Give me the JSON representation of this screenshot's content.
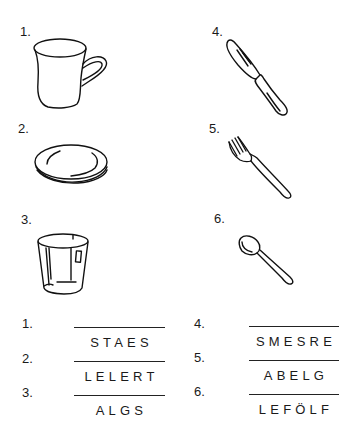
{
  "pictures": [
    {
      "number": "1.",
      "icon": "cup-icon",
      "label": "cup"
    },
    {
      "number": "2.",
      "icon": "plate-icon",
      "label": "plate"
    },
    {
      "number": "3.",
      "icon": "glass-icon",
      "label": "glass"
    },
    {
      "number": "4.",
      "icon": "knife-icon",
      "label": "knife"
    },
    {
      "number": "5.",
      "icon": "fork-icon",
      "label": "fork"
    },
    {
      "number": "6.",
      "icon": "spoon-icon",
      "label": "spoon"
    }
  ],
  "scrambled_words": [
    {
      "number": "1.",
      "letters": "STAES",
      "answer": ""
    },
    {
      "number": "2.",
      "letters": "LELERT",
      "answer": ""
    },
    {
      "number": "3.",
      "letters": "ALGS",
      "answer": ""
    },
    {
      "number": "4.",
      "letters": "SMESRE",
      "answer": ""
    },
    {
      "number": "5.",
      "letters": "ABELG",
      "answer": ""
    },
    {
      "number": "6.",
      "letters": "LEFÖLF",
      "answer": ""
    }
  ]
}
